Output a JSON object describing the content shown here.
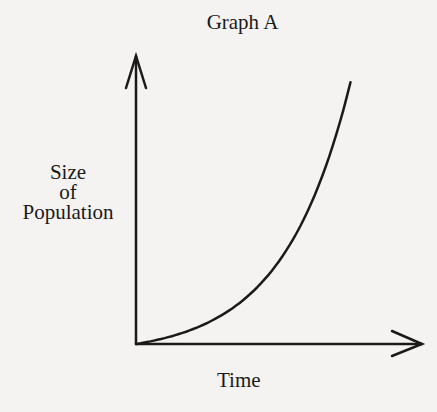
{
  "chart_data": {
    "type": "line",
    "title": "Graph A",
    "xlabel": "Time",
    "ylabel": "Size of Population",
    "ylabel_lines": [
      "Size",
      "of",
      "Population"
    ],
    "grid": false,
    "legend": null,
    "x_ticks": [],
    "y_ticks": [],
    "curve_shape": "exponential (J-shaped) growth",
    "series": [
      {
        "name": "Population",
        "x": [
          0,
          0.1,
          0.2,
          0.3,
          0.4,
          0.5,
          0.6,
          0.7,
          0.75
        ],
        "y": [
          0,
          0.03,
          0.08,
          0.15,
          0.25,
          0.39,
          0.58,
          0.84,
          1.0
        ]
      }
    ],
    "xlim": [
      0,
      1
    ],
    "ylim": [
      0,
      1.1
    ]
  }
}
